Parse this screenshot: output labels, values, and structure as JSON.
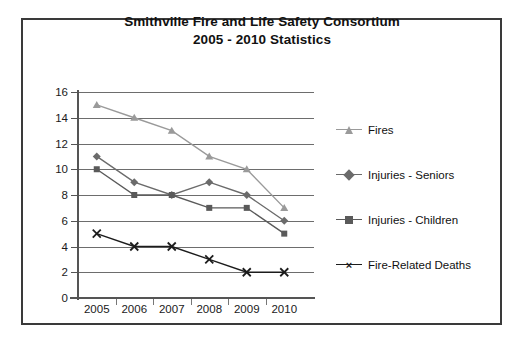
{
  "chart_data": {
    "type": "line",
    "title": "Smithville Fire and Life Safety Consortium\n2005 - 2010 Statistics",
    "title_line1": "Smithville Fire and Life Safety Consortium",
    "title_line2": "2005 - 2010 Statistics",
    "xlabel": "",
    "ylabel": "",
    "categories": [
      "2005",
      "2006",
      "2007",
      "2008",
      "2009",
      "2010"
    ],
    "x": [
      2005,
      2006,
      2007,
      2008,
      2009,
      2010
    ],
    "ylim": [
      0,
      16
    ],
    "ytick_values": [
      0,
      2,
      4,
      6,
      8,
      10,
      12,
      14,
      16
    ],
    "ytick_labels": [
      "0",
      "2",
      "4",
      "6",
      "8",
      "10",
      "12",
      "14",
      "16"
    ],
    "grid": true,
    "grid_axis": "y",
    "legend_position": "right",
    "series": [
      {
        "name": "Fires",
        "values": [
          15,
          14,
          13,
          11,
          10,
          7
        ],
        "color": "#9a9a9a",
        "marker": "triangle"
      },
      {
        "name": "Injuries - Seniors",
        "values": [
          11,
          9,
          8,
          9,
          8,
          6
        ],
        "color": "#6b6b6b",
        "marker": "diamond"
      },
      {
        "name": "Injuries - Children",
        "values": [
          10,
          8,
          8,
          7,
          7,
          5
        ],
        "color": "#5a5a5a",
        "marker": "square"
      },
      {
        "name": "Fire-Related Deaths",
        "values": [
          5,
          4,
          4,
          3,
          2,
          2
        ],
        "color": "#1c1c1c",
        "marker": "x"
      }
    ]
  },
  "legend": {
    "items": [
      {
        "label": "Fires"
      },
      {
        "label": "Injuries - Seniors"
      },
      {
        "label": "Injuries - Children"
      },
      {
        "label": "Fire-Related Deaths"
      }
    ]
  },
  "colors": {
    "frame_border": "#3a3a3a",
    "gridline": "#6d6d6d",
    "axis": "#555555",
    "background": "#ffffff",
    "text": "#111111"
  }
}
